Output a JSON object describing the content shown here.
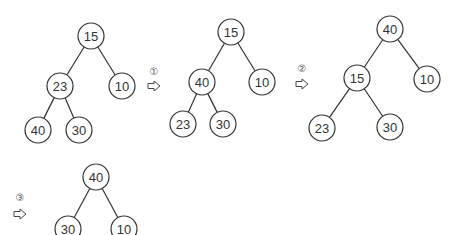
{
  "trees": [
    {
      "id": "initial",
      "nodes": [
        {
          "label": "15",
          "x": 91,
          "y": 36
        },
        {
          "label": "23",
          "x": 60,
          "y": 86
        },
        {
          "label": "10",
          "x": 122,
          "y": 86
        },
        {
          "label": "40",
          "x": 38,
          "y": 130
        },
        {
          "label": "30",
          "x": 79,
          "y": 130
        }
      ],
      "edges": [
        [
          0,
          1
        ],
        [
          0,
          2
        ],
        [
          1,
          3
        ],
        [
          1,
          4
        ]
      ]
    },
    {
      "id": "after-step-1",
      "nodes": [
        {
          "label": "15",
          "x": 231,
          "y": 32
        },
        {
          "label": "40",
          "x": 202,
          "y": 82
        },
        {
          "label": "10",
          "x": 262,
          "y": 82
        },
        {
          "label": "23",
          "x": 183,
          "y": 124
        },
        {
          "label": "30",
          "x": 223,
          "y": 124
        }
      ],
      "edges": [
        [
          0,
          1
        ],
        [
          0,
          2
        ],
        [
          1,
          3
        ],
        [
          1,
          4
        ]
      ]
    },
    {
      "id": "after-step-2",
      "nodes": [
        {
          "label": "40",
          "x": 390,
          "y": 29
        },
        {
          "label": "15",
          "x": 357,
          "y": 78
        },
        {
          "label": "10",
          "x": 427,
          "y": 79
        },
        {
          "label": "23",
          "x": 322,
          "y": 128
        },
        {
          "label": "30",
          "x": 390,
          "y": 127
        }
      ],
      "edges": [
        [
          0,
          1
        ],
        [
          0,
          2
        ],
        [
          1,
          3
        ],
        [
          1,
          4
        ]
      ]
    },
    {
      "id": "after-step-3",
      "nodes": [
        {
          "label": "40",
          "x": 96,
          "y": 177
        },
        {
          "label": "30",
          "x": 68,
          "y": 229
        },
        {
          "label": "10",
          "x": 124,
          "y": 229
        }
      ],
      "edges": [
        [
          0,
          1
        ],
        [
          0,
          2
        ]
      ]
    }
  ],
  "steps": [
    {
      "marker": "①",
      "arrow": "⇨",
      "x": 154,
      "y_marker": 71,
      "y_arrow": 86
    },
    {
      "marker": "②",
      "arrow": "⇨",
      "x": 302,
      "y_marker": 68,
      "y_arrow": 84
    },
    {
      "marker": "③",
      "arrow": "⇨",
      "x": 20,
      "y_marker": 197,
      "y_arrow": 214
    }
  ],
  "node_radius": 13
}
